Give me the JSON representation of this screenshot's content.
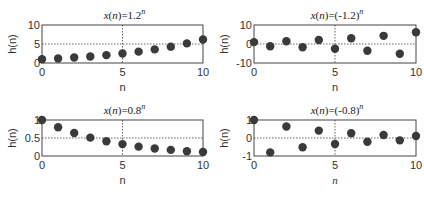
{
  "chart_data": [
    {
      "type": "scatter",
      "title": "x(n)=1.2^n",
      "title_parts": {
        "fn": "x",
        "arg": "n",
        "eq": ")=1.2",
        "exp": "n"
      },
      "xlabel": "n",
      "xlabel_italic": false,
      "ylabel": "h(n)",
      "xlim": [
        0,
        10
      ],
      "ylim": [
        0,
        10
      ],
      "xticks": [
        0,
        5,
        10
      ],
      "yticks": [
        0,
        5,
        10
      ],
      "ytick_labels": [
        "0",
        "5",
        "10"
      ],
      "grid": {
        "x": 5,
        "y": 5
      },
      "x": [
        0,
        1,
        2,
        3,
        4,
        5,
        6,
        7,
        8,
        9,
        10
      ],
      "values": [
        1,
        1.2,
        1.44,
        1.73,
        2.07,
        2.49,
        2.99,
        3.58,
        4.3,
        5.16,
        6.19
      ]
    },
    {
      "type": "scatter",
      "title": "x(n)=(-1.2)^n",
      "title_parts": {
        "fn": "x",
        "arg": "n",
        "eq": ")=(-1.2)",
        "exp": "n"
      },
      "xlabel": "n",
      "xlabel_italic": false,
      "ylabel": "h(n)",
      "xlim": [
        0,
        10
      ],
      "ylim": [
        -10,
        10
      ],
      "xticks": [
        0,
        5,
        10
      ],
      "yticks": [
        -10,
        0,
        10
      ],
      "ytick_labels": [
        "-10",
        "0",
        "10"
      ],
      "grid": {
        "x": 5,
        "y": 0
      },
      "x": [
        0,
        1,
        2,
        3,
        4,
        5,
        6,
        7,
        8,
        9,
        10
      ],
      "values": [
        1,
        -1.2,
        1.44,
        -1.73,
        2.07,
        -2.49,
        2.99,
        -3.58,
        4.3,
        -5.16,
        6.19
      ]
    },
    {
      "type": "scatter",
      "title": "x(n)=0.8^n",
      "title_parts": {
        "fn": "x",
        "arg": "n",
        "eq": ")=0.8",
        "exp": "n"
      },
      "xlabel": "n",
      "xlabel_italic": false,
      "ylabel": "h(n)",
      "xlim": [
        0,
        10
      ],
      "ylim": [
        0,
        1
      ],
      "xticks": [
        0,
        5,
        10
      ],
      "yticks": [
        0,
        0.5,
        1
      ],
      "ytick_labels": [
        "0",
        "0.5",
        "1"
      ],
      "grid": {
        "x": 5,
        "y": 0.5
      },
      "x": [
        0,
        1,
        2,
        3,
        4,
        5,
        6,
        7,
        8,
        9,
        10
      ],
      "values": [
        1,
        0.8,
        0.64,
        0.51,
        0.41,
        0.33,
        0.26,
        0.21,
        0.17,
        0.13,
        0.11
      ]
    },
    {
      "type": "scatter",
      "title": "x(n)=(-0.8)^n",
      "title_parts": {
        "fn": "x",
        "arg": "n",
        "eq": ")=(-0.8)",
        "exp": "n"
      },
      "xlabel": "n",
      "xlabel_italic": true,
      "ylabel": "h(n)",
      "xlim": [
        0,
        10
      ],
      "ylim": [
        -1,
        1
      ],
      "xticks": [
        0,
        5,
        10
      ],
      "yticks": [
        -1,
        0,
        1
      ],
      "ytick_labels": [
        "-1",
        "0",
        "1"
      ],
      "grid": {
        "x": 5,
        "y": 0
      },
      "x": [
        0,
        1,
        2,
        3,
        4,
        5,
        6,
        7,
        8,
        9,
        10
      ],
      "values": [
        1,
        -0.8,
        0.64,
        -0.51,
        0.41,
        -0.33,
        0.26,
        -0.21,
        0.17,
        -0.13,
        0.11
      ]
    }
  ],
  "style": {
    "marker_color": "#3a3a3a",
    "axis_color": "#444444",
    "grid_color": "#555555"
  },
  "layout": {
    "panels": [
      {
        "left": 42,
        "right": 203,
        "top": 25,
        "bottom": 63
      },
      {
        "left": 254,
        "right": 416,
        "top": 25,
        "bottom": 63
      },
      {
        "left": 42,
        "right": 203,
        "top": 120,
        "bottom": 156
      },
      {
        "left": 254,
        "right": 416,
        "top": 120,
        "bottom": 156
      }
    ]
  }
}
